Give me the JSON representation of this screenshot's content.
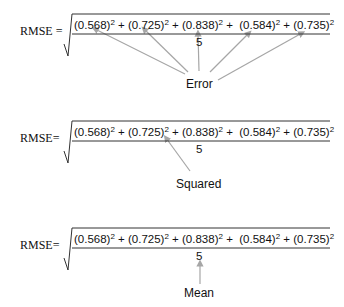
{
  "equations": [
    {
      "lhs": "RMSE =",
      "terms": [
        "(0.568)",
        "(0.725)",
        "(0.838)",
        "(0.584)",
        "(0.735)"
      ],
      "exponent": "2",
      "operator": "+",
      "denominator": "5",
      "caption": "Error"
    },
    {
      "lhs": "RMSE=",
      "terms": [
        "(0.568)",
        "(0.725)",
        "(0.838)",
        "(0.584)",
        "(0.735)"
      ],
      "exponent": "2",
      "operator": "+",
      "denominator": "5",
      "caption": "Squared"
    },
    {
      "lhs": "RMSE=",
      "terms": [
        "(0.568)",
        "(0.725)",
        "(0.838)",
        "(0.584)",
        "(0.735)"
      ],
      "exponent": "2",
      "operator": "+",
      "denominator": "5",
      "caption": "Mean"
    }
  ],
  "colors": {
    "text": "#111111",
    "arrow": "#a6a6a6",
    "rule": "#333333"
  }
}
